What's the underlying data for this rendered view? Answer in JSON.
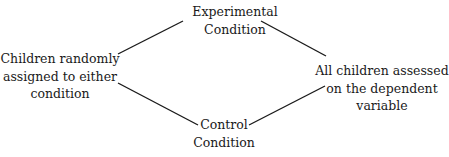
{
  "diagram": {
    "type": "experimental-design-flow",
    "line_color": "#1a1a1a",
    "nodes": {
      "left": {
        "lines": [
          "Children randomly",
          "assigned to either",
          "condition"
        ]
      },
      "top": {
        "lines": [
          "Experimental",
          "Condition"
        ]
      },
      "bottom": {
        "lines": [
          "Control",
          "Condition"
        ]
      },
      "right": {
        "lines": [
          "All children assessed",
          "on the dependent",
          "variable"
        ]
      }
    },
    "edges": [
      {
        "from": "left",
        "to": "top"
      },
      {
        "from": "top",
        "to": "right"
      },
      {
        "from": "left",
        "to": "bottom"
      },
      {
        "from": "bottom",
        "to": "right"
      }
    ]
  }
}
